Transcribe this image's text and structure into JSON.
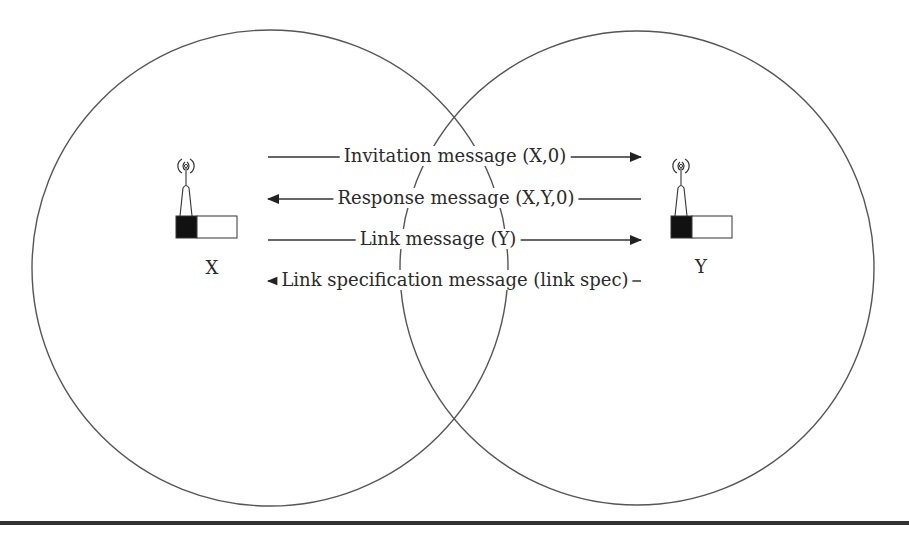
{
  "diagram": {
    "type": "wireless-link-establishment",
    "nodes": [
      {
        "id": "X",
        "label": "X",
        "icon": "wireless-node-icon"
      },
      {
        "id": "Y",
        "label": "Y",
        "icon": "wireless-node-icon"
      }
    ],
    "messages": [
      {
        "label": "Invitation message (X,0)",
        "direction": "X->Y"
      },
      {
        "label": "Response message (X,Y,0)",
        "direction": "Y->X"
      },
      {
        "label": "Link message (Y)",
        "direction": "X->Y"
      },
      {
        "label": "Link specification message (link spec)",
        "direction": "Y->X"
      }
    ],
    "ranges": [
      {
        "node": "X",
        "shape": "circle"
      },
      {
        "node": "Y",
        "shape": "circle"
      }
    ],
    "colors": {
      "stroke": "#4a4a4a",
      "text": "#2a2a2a",
      "rule": "#333333",
      "fill": "#111111"
    }
  }
}
